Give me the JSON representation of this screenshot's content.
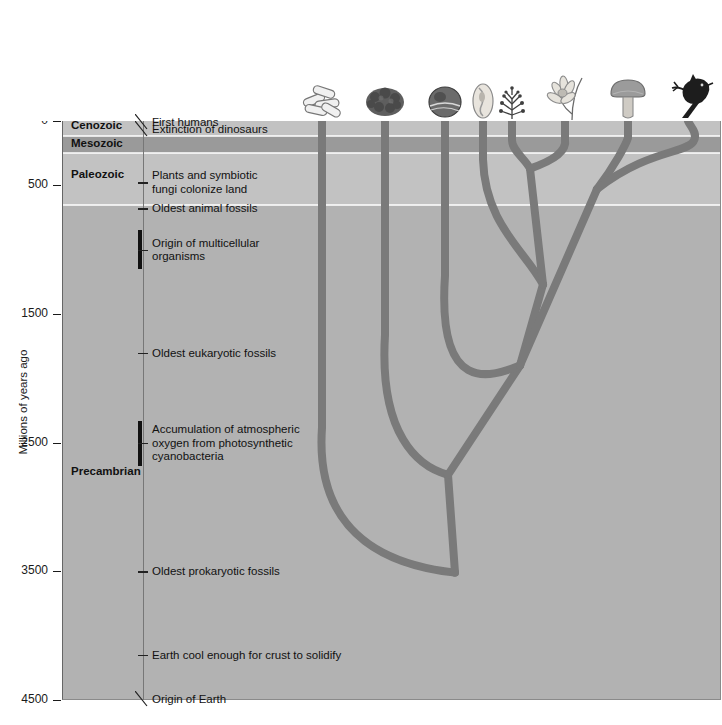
{
  "figure": {
    "yaxis_title": "Millions of years ago"
  },
  "header": {
    "groups": [
      {
        "label": "Prokaryotes",
        "x": 362,
        "y": 10,
        "bracket_left": 300,
        "bracket_right": 424,
        "stem_x": 362
      },
      {
        "label": "Eukaryotes",
        "x": 596,
        "y": 10,
        "bracket_left": 429,
        "bracket_right": 720,
        "stem_x": 596
      }
    ],
    "taxa": [
      {
        "label": "Bacteria",
        "x": 327,
        "branch_x": 322
      },
      {
        "label": "Archaea",
        "x": 392,
        "branch_x": 385
      },
      {
        "label": "Protists",
        "x": 477,
        "branch_x": 470
      },
      {
        "label": "Plants",
        "x": 561,
        "branch_x": 565
      },
      {
        "label": "Fungi",
        "x": 625,
        "branch_x": 628
      },
      {
        "label": "Animals",
        "x": 689,
        "branch_x": 694
      }
    ],
    "protist_bracket": {
      "left": 430,
      "right": 523,
      "stem_x": 477
    },
    "taxa_label_y": 45
  },
  "eras": [
    {
      "name": "Cenozoic",
      "top_mya": 0,
      "bottom_mya": 120,
      "color": "#c2c2c2",
      "label_mya": 40
    },
    {
      "name": "Mesozoic",
      "top_mya": 120,
      "bottom_mya": 245,
      "color": "#9a9a9a",
      "label_mya": 182
    },
    {
      "name": "Paleozoic",
      "top_mya": 245,
      "bottom_mya": 655,
      "color": "#c2c2c2",
      "label_mya": 420
    },
    {
      "name": "Precambrian",
      "top_mya": 655,
      "bottom_mya": 4500,
      "color": "#b2b2b2",
      "label_mya": 2730
    }
  ],
  "yaxis": {
    "ticks": [
      "0",
      "500",
      "1500",
      "2500",
      "3500",
      "4500"
    ],
    "tick_values": [
      0,
      500,
      1500,
      2500,
      3500,
      4500
    ],
    "min": 0,
    "max": 4500
  },
  "events": [
    {
      "label": "First humans",
      "mya": 10,
      "marker": "leader"
    },
    {
      "label": "Extinction of dinosaurs",
      "mya": 65,
      "marker": "leader"
    },
    {
      "label": "Plants and symbiotic\nfungi colonize land",
      "mya": 475,
      "marker": "tick"
    },
    {
      "label": "Oldest animal fossils",
      "mya": 680,
      "marker": "tick"
    },
    {
      "label": "Origin of multicellular\norganisms",
      "mya": 1000,
      "marker": "bar",
      "bar_from": 850,
      "bar_to": 1150
    },
    {
      "label": "Oldest eukaryotic fossils",
      "mya": 1800,
      "marker": "tick"
    },
    {
      "label": "Accumulation of atmospheric\noxygen from photosynthetic\ncyanobacteria",
      "mya": 2500,
      "marker": "bar",
      "bar_from": 2330,
      "bar_to": 2680
    },
    {
      "label": "Oldest prokaryotic fossils",
      "mya": 3500,
      "marker": "tick"
    },
    {
      "label": "Earth cool enough for crust to solidify",
      "mya": 4150,
      "marker": "tick"
    },
    {
      "label": "Origin of Earth",
      "mya": 4490,
      "marker": "leader"
    }
  ],
  "tree": {
    "line_color": "#7a7a7a",
    "line_width": 8,
    "root_mya": 3900,
    "root_x": 455,
    "nodes": [
      {
        "name": "root-split",
        "x": 455,
        "mya": 3510
      },
      {
        "name": "bacteria-tip",
        "x": 322,
        "mya": 0
      },
      {
        "name": "archaea-tip",
        "x": 385,
        "mya": 0
      },
      {
        "name": "archaea-eukaryote-split",
        "x": 448,
        "mya": 2750
      },
      {
        "name": "protist-tip-1",
        "x": 445,
        "mya": 0
      },
      {
        "name": "protist-tip-2",
        "x": 483,
        "mya": 0
      },
      {
        "name": "protist-tip-3",
        "x": 512,
        "mya": 0
      },
      {
        "name": "plants-tip",
        "x": 565,
        "mya": 0
      },
      {
        "name": "fungi-tip",
        "x": 628,
        "mya": 0
      },
      {
        "name": "animals-tip",
        "x": 694,
        "mya": 0
      },
      {
        "name": "plant-protist-node",
        "x": 543,
        "mya": 1270
      },
      {
        "name": "crown-node",
        "x": 520,
        "mya": 1900
      },
      {
        "name": "fungi-animal-node",
        "x": 597,
        "mya": 530
      }
    ]
  },
  "organisms": [
    {
      "name": "bacteria-icon",
      "x": 322,
      "glyph": "rods"
    },
    {
      "name": "archaea-icon",
      "x": 385,
      "glyph": "blob"
    },
    {
      "name": "protist-icon-1",
      "x": 445,
      "glyph": "cell"
    },
    {
      "name": "protist-icon-2",
      "x": 483,
      "glyph": "amoeba"
    },
    {
      "name": "protist-icon-3",
      "x": 512,
      "glyph": "alga"
    },
    {
      "name": "plant-icon",
      "x": 565,
      "glyph": "flower"
    },
    {
      "name": "fungi-icon",
      "x": 628,
      "glyph": "mushroom"
    },
    {
      "name": "animal-icon",
      "x": 690,
      "glyph": "bird"
    }
  ],
  "colors": {
    "plot_background": "#b2b2b2",
    "branch": "#7a7a7a",
    "text": "#1a1a1a",
    "page_background": "#ffffff"
  }
}
